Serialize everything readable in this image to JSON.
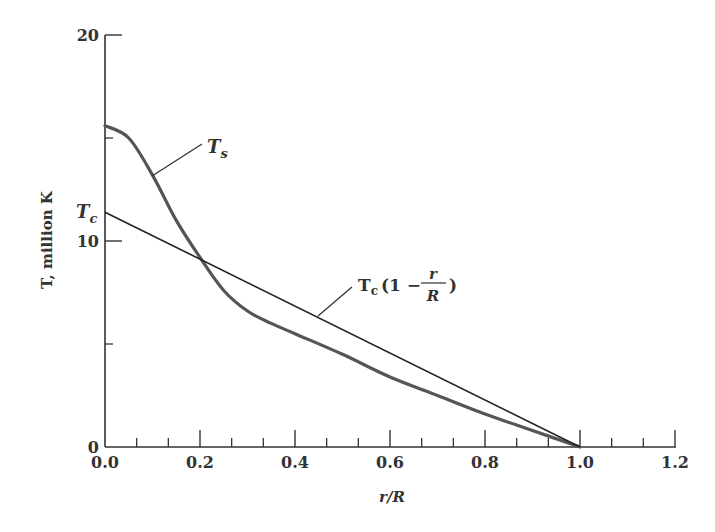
{
  "chart_data": {
    "type": "line",
    "title": "",
    "xlabel": "r/R",
    "ylabel": "T, million K",
    "xlim": [
      0.0,
      1.2
    ],
    "ylim": [
      0,
      20
    ],
    "x_ticks": [
      "0.0",
      "0.2",
      "0.4",
      "0.6",
      "0.8",
      "1.0",
      "1.2"
    ],
    "y_ticks": [
      "0",
      "10",
      "20"
    ],
    "grid": false,
    "legend": "none (inline annotations)",
    "series": [
      {
        "name": "T_s",
        "label_main": "T",
        "label_sub": "s",
        "x": [
          0.0,
          0.05,
          0.1,
          0.15,
          0.2,
          0.25,
          0.3,
          0.35,
          0.4,
          0.5,
          0.6,
          0.7,
          0.8,
          0.9,
          1.0
        ],
        "values": [
          15.6,
          15.0,
          13.2,
          11.0,
          9.2,
          7.6,
          6.6,
          6.0,
          5.5,
          4.5,
          3.4,
          2.5,
          1.6,
          0.8,
          0.0
        ]
      },
      {
        "name": "T_c(1 - r/R)",
        "label_main": "T",
        "label_sub": "c",
        "label_rest": "(1 −",
        "label_num": "r",
        "label_den": "R",
        "label_close": ")",
        "x": [
          0.0,
          1.0
        ],
        "values": [
          11.4,
          0.0
        ]
      }
    ],
    "annotations": [
      {
        "text": "T_c",
        "main": "T",
        "sub": "c",
        "at_y": 11.4,
        "position": "left of y-axis"
      }
    ]
  }
}
